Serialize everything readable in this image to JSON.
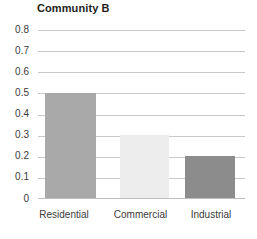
{
  "chart_data": {
    "type": "bar",
    "title": "Community B",
    "xlabel": "",
    "ylabel": "",
    "categories": [
      "Residential",
      "Commercial",
      "Industrial"
    ],
    "values": [
      0.5,
      0.3,
      0.2
    ],
    "series": [
      {
        "name": "Community B",
        "values": [
          0.5,
          0.3,
          0.2
        ]
      }
    ],
    "bar_colors": [
      "#a9a9a9",
      "#ededed",
      "#8c8c8c"
    ],
    "ylim": [
      0,
      0.8
    ],
    "ytick_labels": [
      "0.8",
      "0.7",
      "0.6",
      "0.5",
      "0.4",
      "0.3",
      "0.2",
      "0.1",
      "0"
    ],
    "ytick_values": [
      0.8,
      0.7,
      0.6,
      0.5,
      0.4,
      0.3,
      0.2,
      0.1,
      0
    ],
    "grid": true,
    "grid_color": "#c9c9c9",
    "legend": false,
    "legend_position": "none",
    "background_color": "#ffffff",
    "text_color": "#3a3a3a",
    "title_color": "#231f20"
  }
}
